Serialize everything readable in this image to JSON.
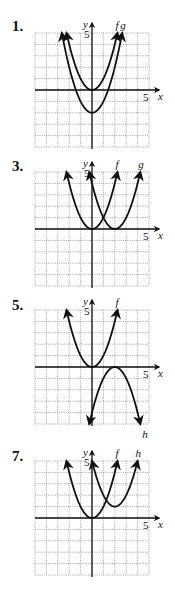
{
  "chart_data": [
    {
      "type": "line",
      "problem": "1.",
      "xlabel": "x",
      "ylabel": "y",
      "xlim": [
        -5,
        5
      ],
      "ylim": [
        -5,
        5
      ],
      "tick_labels": {
        "x": "5",
        "y": "5"
      },
      "grid": true,
      "series": [
        {
          "name": "f",
          "equation": "x^2",
          "vertex": [
            0,
            0
          ],
          "opens": "up"
        },
        {
          "name": "g",
          "equation": "x^2 - 2",
          "vertex": [
            0,
            -2
          ],
          "opens": "up"
        }
      ]
    },
    {
      "type": "line",
      "problem": "3.",
      "xlabel": "x",
      "ylabel": "y",
      "xlim": [
        -5,
        5
      ],
      "ylim": [
        -5,
        5
      ],
      "tick_labels": {
        "x": "5",
        "y": "5"
      },
      "grid": true,
      "series": [
        {
          "name": "f",
          "equation": "x^2",
          "vertex": [
            0,
            0
          ],
          "opens": "up"
        },
        {
          "name": "g",
          "equation": "(x - 2)^2",
          "vertex": [
            2,
            0
          ],
          "opens": "up"
        }
      ]
    },
    {
      "type": "line",
      "problem": "5.",
      "xlabel": "x",
      "ylabel": "y",
      "xlim": [
        -5,
        5
      ],
      "ylim": [
        -5,
        5
      ],
      "tick_labels": {
        "x": "5",
        "y": "5"
      },
      "grid": true,
      "series": [
        {
          "name": "f",
          "equation": "x^2",
          "vertex": [
            0,
            0
          ],
          "opens": "up"
        },
        {
          "name": "h",
          "equation": "-(x - 2)^2",
          "vertex": [
            2,
            0
          ],
          "opens": "down"
        }
      ]
    },
    {
      "type": "line",
      "problem": "7.",
      "xlabel": "x",
      "ylabel": "y",
      "xlim": [
        -5,
        5
      ],
      "ylim": [
        -5,
        5
      ],
      "tick_labels": {
        "x": "5",
        "y": "5"
      },
      "grid": true,
      "series": [
        {
          "name": "f",
          "equation": "x^2",
          "vertex": [
            0,
            0
          ],
          "opens": "up"
        },
        {
          "name": "h",
          "equation": "(x - 2)^2 + 1",
          "vertex": [
            2,
            1
          ],
          "opens": "up"
        }
      ]
    }
  ],
  "colors": {
    "curve": "#111111",
    "axis": "#111111",
    "grid": "#8a8a8a"
  }
}
